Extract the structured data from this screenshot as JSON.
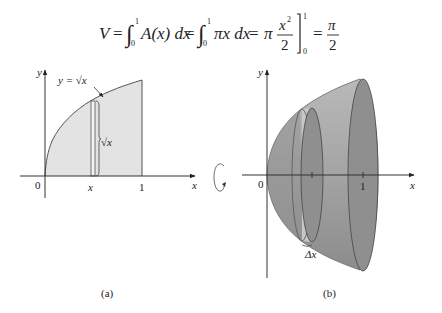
{
  "formula": {
    "lhs": "V",
    "eq": "=",
    "int_upper": "1",
    "int_lower": "0",
    "term1": "A(x) dx",
    "term2": "πx dx",
    "pi": "π",
    "frac_num": "x",
    "frac_exp": "2",
    "frac_den": "2",
    "eval_upper": "1",
    "eval_lower": "0",
    "result_num": "π",
    "result_den": "2"
  },
  "panel_a": {
    "caption": "(a)",
    "y_axis_label": "y",
    "x_axis_label": "x",
    "origin_label": "0",
    "x_tick_label": "x",
    "one_label": "1",
    "curve_label": "y = √x",
    "strip_label": "√x",
    "curve": "y = sqrt(x)",
    "region_fill": "#e3e3e3"
  },
  "panel_b": {
    "caption": "(b)",
    "y_axis_label": "y",
    "x_axis_label": "x",
    "origin_label": "0",
    "one_label": "1",
    "delta_label": "Δx",
    "solid_fill": "#9a9a9a"
  },
  "rotation_icon": "rotation-arrow"
}
